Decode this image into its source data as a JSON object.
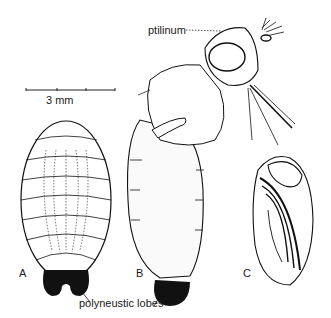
{
  "figure": {
    "scale_bar": {
      "label": "3 mm",
      "ticks": 4
    },
    "callouts": {
      "ptilinum": "ptilinum",
      "polyneustic_lobes": "polyneustic lobes"
    },
    "panels": [
      {
        "letter": "A",
        "subject": "puparium with lobes, dorsal view"
      },
      {
        "letter": "B",
        "subject": "emerging adult fly from puparium"
      },
      {
        "letter": "C",
        "subject": "pupa, lateral view"
      }
    ],
    "colors": {
      "ink": "#111111",
      "background": "#ffffff",
      "stipple": "#555555"
    }
  }
}
